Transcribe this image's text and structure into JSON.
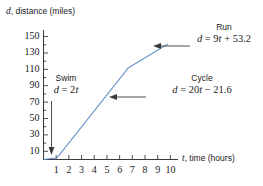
{
  "chart_data": {
    "type": "line",
    "title": "",
    "xlabel": "t, time (hours)",
    "ylabel": "d, distance (miles)",
    "xlabel_var": "t",
    "xlabel_rest": ", time (hours)",
    "ylabel_var": "d",
    "ylabel_rest": ", distance (miles)",
    "xlim": [
      0,
      10.6
    ],
    "ylim": [
      0,
      158
    ],
    "grid": false,
    "legend": "none",
    "line_color": "#6a93c8",
    "xticks": [
      "1",
      "2",
      "3",
      "4",
      "5",
      "6",
      "7",
      "8",
      "9",
      "10"
    ],
    "xtick_values": [
      1,
      2,
      3,
      4,
      5,
      6,
      7,
      8,
      9,
      10
    ],
    "yticks": [
      "10",
      "30",
      "50",
      "70",
      "90",
      "110",
      "130",
      "150"
    ],
    "ytick_values": [
      10,
      30,
      50,
      70,
      90,
      110,
      130,
      150
    ],
    "y_minor_step": 10,
    "series": [
      {
        "name": "Triathlon distance",
        "x": [
          0,
          1.08,
          6.7,
          9.8
        ],
        "y": [
          0,
          2.2,
          112,
          141
        ]
      }
    ],
    "segments": [
      {
        "phase": "Swim",
        "equation": "d = 2t",
        "slope": 2,
        "intercept": 0,
        "t_start": 0,
        "t_end": 1.08
      },
      {
        "phase": "Cycle",
        "equation": "d = 20t - 21.6",
        "slope": 20,
        "intercept": -21.6,
        "t_start": 1.08,
        "t_end": 6.7
      },
      {
        "phase": "Run",
        "equation": "d = 9t + 53.2",
        "slope": 9,
        "intercept": 53.2,
        "t_start": 6.7,
        "t_end": 9.8
      }
    ],
    "annotations": [
      {
        "id": "swim",
        "label": "Swim",
        "eq_lhs": "d",
        "eq_rel": " = 2",
        "eq_var": "t",
        "eq_tail": "",
        "equation_text": "d = 2t",
        "arrow": "down"
      },
      {
        "id": "cycle",
        "label": "Cycle",
        "eq_lhs": "d",
        "eq_rel": " = 20",
        "eq_var": "t",
        "eq_tail": " − 21.6",
        "equation_text": "d = 20t − 21.6",
        "arrow": "left"
      },
      {
        "id": "run",
        "label": "Run",
        "eq_lhs": "d",
        "eq_rel": " = 9",
        "eq_var": "t",
        "eq_tail": " + 53.2",
        "equation_text": "d = 9t + 53.2",
        "arrow": "left"
      }
    ]
  },
  "colors": {
    "line": "#6a93c8",
    "axis": "#3a3a3a",
    "text": "#1a1a1a",
    "background": "#ffffff"
  }
}
